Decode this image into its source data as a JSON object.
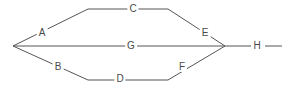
{
  "diagram": {
    "background_color": "#ffffff",
    "line_color": "#555555",
    "label_color": "#4a4a4a",
    "line_width": 1,
    "canvas": {
      "width": 290,
      "height": 91
    },
    "nodes": [
      {
        "id": "A",
        "label": "A",
        "x": 42,
        "y": 33
      },
      {
        "id": "C",
        "label": "C",
        "x": 133,
        "y": 9
      },
      {
        "id": "E",
        "label": "E",
        "x": 205,
        "y": 33
      },
      {
        "id": "G",
        "label": "G",
        "x": 131,
        "y": 46
      },
      {
        "id": "H",
        "label": "H",
        "x": 257,
        "y": 46
      },
      {
        "id": "B",
        "label": "B",
        "x": 58,
        "y": 67
      },
      {
        "id": "D",
        "label": "D",
        "x": 120,
        "y": 79
      },
      {
        "id": "F",
        "label": "F",
        "x": 182,
        "y": 67
      }
    ],
    "vertices": {
      "left_fork": {
        "x": 13,
        "y": 46
      },
      "right_fork": {
        "x": 225,
        "y": 46
      },
      "top_left_bend": {
        "x": 88,
        "y": 9
      },
      "top_right_bend": {
        "x": 168,
        "y": 9
      },
      "bottom_left_bend": {
        "x": 88,
        "y": 80
      },
      "bottom_right_bend": {
        "x": 168,
        "y": 80
      }
    },
    "edges": [
      {
        "name": "edge-upper-left",
        "from": "left_fork",
        "to": "top_left_bend",
        "path": "M 13 46 L 88 9"
      },
      {
        "name": "edge-top-horizontal",
        "from": "top_left_bend",
        "to": "top_right_bend",
        "path": "M 88 9 L 168 9"
      },
      {
        "name": "edge-upper-right",
        "from": "top_right_bend",
        "to": "right_fork",
        "path": "M 168 9 L 225 46"
      },
      {
        "name": "edge-middle-horizontal",
        "from": "left_fork",
        "to": "right_fork",
        "path": "M 13 46 L 225 46"
      },
      {
        "name": "edge-lower-left",
        "from": "left_fork",
        "to": "bottom_left_bend",
        "path": "M 13 46 L 88 80"
      },
      {
        "name": "edge-bottom-horizontal",
        "from": "bottom_left_bend",
        "to": "bottom_right_bend",
        "path": "M 88 80 L 168 80"
      },
      {
        "name": "edge-lower-right",
        "from": "bottom_right_bend",
        "to": "right_fork",
        "path": "M 168 80 L 225 46"
      },
      {
        "name": "edge-tail-to-h",
        "from": "right_fork",
        "to": "H",
        "path": "M 225 46 L 251 46"
      },
      {
        "name": "edge-tail-after-h",
        "from": "H",
        "to": "end",
        "path": "M 265 46 L 282 46"
      }
    ]
  }
}
